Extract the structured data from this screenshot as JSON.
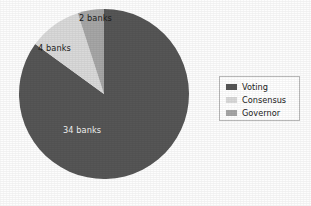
{
  "chart_data": {
    "type": "pie",
    "title": "",
    "subtitle": "",
    "xlabel": "",
    "ylabel": "",
    "grid": false,
    "legend_position": "right",
    "unit": "banks",
    "total": 40,
    "start_angle_deg": 0,
    "direction": "clockwise",
    "categories": [
      "Voting",
      "Consensus",
      "Governor"
    ],
    "values": [
      34,
      4,
      2
    ],
    "data_labels": [
      "34 banks",
      "4 banks",
      "2 banks"
    ],
    "colors": [
      "#565656",
      "#d9d9d9",
      "#a6a6a6"
    ],
    "slices": [
      {
        "name": "Voting",
        "value": 34,
        "label": "34 banks",
        "color": "#565656",
        "percent": 85,
        "angle_deg": 306,
        "label_color": "#f2f2f2"
      },
      {
        "name": "Consensus",
        "value": 4,
        "label": "4 banks",
        "color": "#d9d9d9",
        "percent": 10,
        "angle_deg": 36,
        "label_color": "#1b1b1b"
      },
      {
        "name": "Governor",
        "value": 2,
        "label": "2 banks",
        "color": "#a6a6a6",
        "percent": 5,
        "angle_deg": 18,
        "label_color": "#1b1b1b"
      }
    ]
  },
  "legend": {
    "items": [
      {
        "label": "Voting",
        "color": "#565656"
      },
      {
        "label": "Consensus",
        "color": "#d9d9d9"
      },
      {
        "label": "Governor",
        "color": "#a6a6a6"
      }
    ]
  },
  "geometry": {
    "center_x": 104,
    "center_y": 94,
    "radius": 85
  }
}
